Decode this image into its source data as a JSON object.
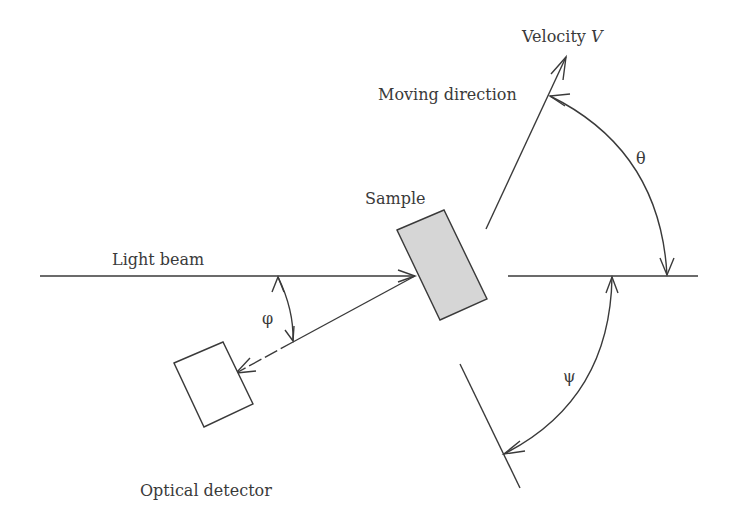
{
  "diagram": {
    "labels": {
      "velocity": "Velocity ",
      "velocity_symbol": "V",
      "moving_direction": "Moving direction",
      "sample": "Sample",
      "light_beam": "Light beam",
      "optical_detector": "Optical detector",
      "phi": "φ",
      "theta": "θ",
      "psi": "ψ"
    },
    "colors": {
      "stroke": "#3a3a3a",
      "sample_fill": "#d6d6d6",
      "background": "#ffffff"
    }
  }
}
